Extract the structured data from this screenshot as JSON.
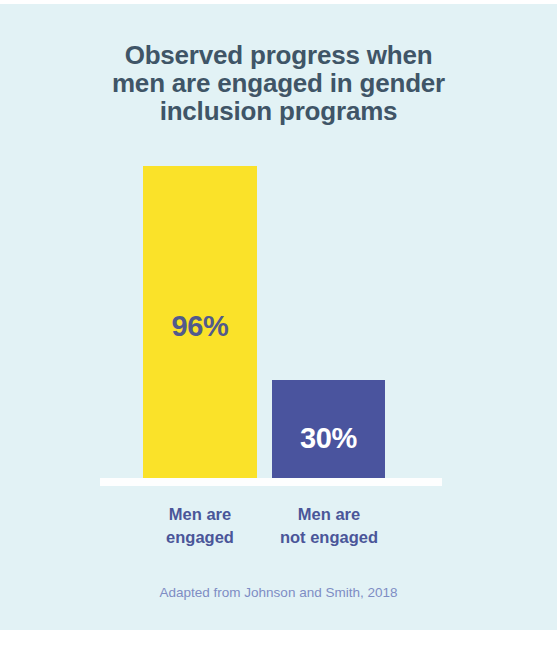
{
  "chart_data": {
    "type": "bar",
    "title": "Observed progress when\nmen are engaged in gender\ninclusion programs",
    "categories": [
      "Men are\nengaged",
      "Men are\nnot engaged"
    ],
    "values": [
      96,
      30
    ],
    "value_labels": [
      "96%",
      "30%"
    ],
    "xlabel": "",
    "ylabel": "",
    "ylim": [
      0,
      100
    ],
    "grid": false,
    "legend": "none",
    "caption": "Adapted from Johnson and Smith, 2018",
    "series": [
      {
        "name": "Observed progress",
        "values": [
          96,
          30
        ],
        "colors": [
          "#fae229",
          "#4a549e"
        ]
      }
    ]
  },
  "colors": {
    "background": "#e2f2f5",
    "canvas": "#ffffff",
    "bar_engaged": "#fae229",
    "bar_not_engaged": "#4a549e",
    "title_text": "#3f5567",
    "value_engaged_text": "#525a8c",
    "value_not_engaged_text": "#ffffff",
    "category_text": "#4a5699",
    "caption_text": "#7e8dc4",
    "baseline": "#fdfefe"
  }
}
